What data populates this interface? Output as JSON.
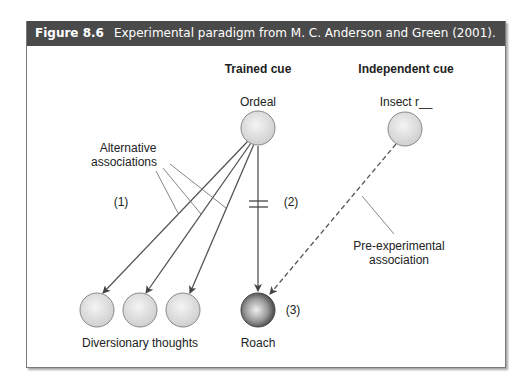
{
  "figure": {
    "number": "Figure 8.6",
    "caption": "Experimental paradigm from M. C. Anderson and Green (2001)."
  },
  "columns": {
    "trained": "Trained cue",
    "independent": "Independent cue"
  },
  "nodes": {
    "ordeal": "Ordeal",
    "insect": "Insect r__",
    "diversionary": "Diversionary thoughts",
    "roach": "Roach"
  },
  "annotations": {
    "alternative_line1": "Alternative",
    "alternative_line2": "associations",
    "pre_line1": "Pre-experimental",
    "pre_line2": "association",
    "label1": "(1)",
    "label2": "(2)",
    "label3": "(3)"
  },
  "colors": {
    "header_bg": "#4a4a4a",
    "node_fill": "#e2e2e2",
    "roach_dark": "#3a3a3a",
    "line": "#555555"
  }
}
